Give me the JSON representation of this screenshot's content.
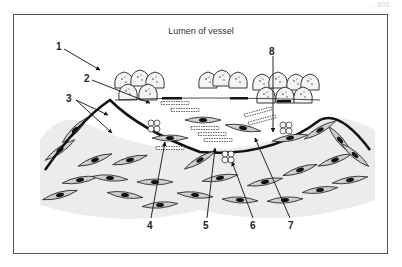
{
  "page": {
    "header_fragment": "… 101"
  },
  "figure": {
    "title": "Lumen of vessel",
    "labels": [
      {
        "id": "1",
        "text": "1",
        "x": 60,
        "y": 49
      },
      {
        "id": "2",
        "text": "2",
        "x": 86,
        "y": 78
      },
      {
        "id": "3",
        "text": "3",
        "x": 67,
        "y": 97
      },
      {
        "id": "4",
        "text": "4",
        "x": 148,
        "y": 228
      },
      {
        "id": "5",
        "text": "5",
        "x": 204,
        "y": 228
      },
      {
        "id": "6",
        "text": "6",
        "x": 252,
        "y": 228
      },
      {
        "id": "7",
        "text": "7",
        "x": 290,
        "y": 228
      },
      {
        "id": "8",
        "text": "8",
        "x": 270,
        "y": 51
      }
    ],
    "colors": {
      "frame": "#555555",
      "ink": "#1a1a1a",
      "cell_fill": "#bdbdbd",
      "background": "#ffffff"
    }
  }
}
